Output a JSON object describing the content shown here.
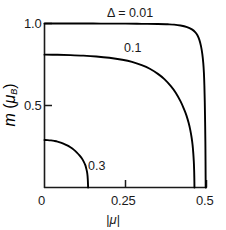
{
  "chart_data": {
    "type": "line",
    "title": "",
    "xlabel": "|μ|",
    "ylabel": "m (μ_B)",
    "xlim": [
      0,
      0.5
    ],
    "ylim": [
      0,
      1.0
    ],
    "grid": false,
    "legend_position": "inline-annotations",
    "xticks": [
      0,
      0.25,
      0.5
    ],
    "xtick_labels": [
      "0",
      "0.25",
      "0.5"
    ],
    "yticks": [
      0,
      0.5,
      1.0
    ],
    "ytick_labels": [
      "0",
      "0.5",
      "1.0"
    ],
    "annotations": [
      {
        "text": "Δ = 0.01",
        "x": 0.3,
        "y": 1.05
      },
      {
        "text": "0.1",
        "x": 0.325,
        "y": 0.9
      },
      {
        "text": "0.3",
        "x": 0.155,
        "y": 0.115
      }
    ],
    "series": [
      {
        "name": "Δ = 0.01",
        "label": "Δ = 0.01",
        "delta": 0.01,
        "m0": 1.0,
        "x_end": 0.497,
        "points": [
          [
            0.0,
            1.0
          ],
          [
            0.05,
            1.0
          ],
          [
            0.1,
            1.0
          ],
          [
            0.15,
            1.0
          ],
          [
            0.2,
            0.999
          ],
          [
            0.25,
            0.999
          ],
          [
            0.3,
            0.998
          ],
          [
            0.35,
            0.997
          ],
          [
            0.38,
            0.995
          ],
          [
            0.4,
            0.993
          ],
          [
            0.42,
            0.988
          ],
          [
            0.44,
            0.978
          ],
          [
            0.455,
            0.964
          ],
          [
            0.465,
            0.948
          ],
          [
            0.472,
            0.928
          ],
          [
            0.478,
            0.9
          ],
          [
            0.483,
            0.862
          ],
          [
            0.487,
            0.815
          ],
          [
            0.49,
            0.76
          ],
          [
            0.492,
            0.7
          ],
          [
            0.4935,
            0.62
          ],
          [
            0.4947,
            0.52
          ],
          [
            0.4957,
            0.4
          ],
          [
            0.4965,
            0.28
          ],
          [
            0.497,
            0.16
          ],
          [
            0.4973,
            0.06
          ],
          [
            0.4975,
            0.0
          ]
        ]
      },
      {
        "name": "0.1",
        "label": "0.1",
        "delta": 0.1,
        "m0": 0.81,
        "x_end": 0.462,
        "points": [
          [
            0.0,
            0.81
          ],
          [
            0.04,
            0.809
          ],
          [
            0.08,
            0.807
          ],
          [
            0.12,
            0.804
          ],
          [
            0.16,
            0.799
          ],
          [
            0.2,
            0.791
          ],
          [
            0.24,
            0.779
          ],
          [
            0.27,
            0.766
          ],
          [
            0.3,
            0.746
          ],
          [
            0.325,
            0.724
          ],
          [
            0.35,
            0.693
          ],
          [
            0.37,
            0.661
          ],
          [
            0.39,
            0.618
          ],
          [
            0.405,
            0.578
          ],
          [
            0.42,
            0.525
          ],
          [
            0.43,
            0.481
          ],
          [
            0.438,
            0.44
          ],
          [
            0.445,
            0.393
          ],
          [
            0.45,
            0.35
          ],
          [
            0.454,
            0.305
          ],
          [
            0.457,
            0.26
          ],
          [
            0.4592,
            0.21
          ],
          [
            0.4608,
            0.16
          ],
          [
            0.4618,
            0.11
          ],
          [
            0.4624,
            0.06
          ],
          [
            0.4628,
            0.0
          ]
        ]
      },
      {
        "name": "0.3",
        "label": "0.3",
        "delta": 0.3,
        "m0": 0.29,
        "x_end": 0.134,
        "points": [
          [
            0.0,
            0.29
          ],
          [
            0.01,
            0.289
          ],
          [
            0.02,
            0.287
          ],
          [
            0.03,
            0.284
          ],
          [
            0.04,
            0.28
          ],
          [
            0.05,
            0.274
          ],
          [
            0.06,
            0.266
          ],
          [
            0.07,
            0.257
          ],
          [
            0.08,
            0.245
          ],
          [
            0.09,
            0.231
          ],
          [
            0.1,
            0.213
          ],
          [
            0.108,
            0.196
          ],
          [
            0.115,
            0.178
          ],
          [
            0.121,
            0.158
          ],
          [
            0.126,
            0.136
          ],
          [
            0.129,
            0.115
          ],
          [
            0.1315,
            0.092
          ],
          [
            0.133,
            0.068
          ],
          [
            0.1338,
            0.042
          ],
          [
            0.1343,
            0.018
          ],
          [
            0.1345,
            0.0
          ]
        ]
      }
    ]
  },
  "axes": {
    "ylabel_main": "m",
    "ylabel_paren_open": " (",
    "ylabel_mu": "μ",
    "ylabel_sub": "B",
    "ylabel_paren_close": ")",
    "xlabel": "|μ|"
  },
  "colors": {
    "axis": "#1a1a1a",
    "curve": "#000000",
    "background": "#ffffff",
    "text": "#1a1a1a"
  }
}
